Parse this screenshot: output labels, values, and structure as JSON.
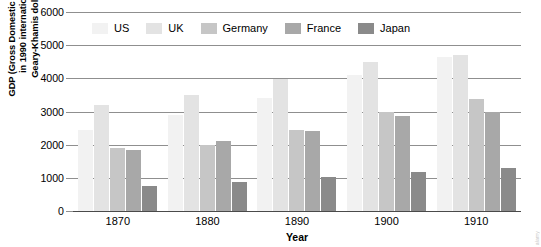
{
  "chart_data": {
    "type": "bar",
    "title": "",
    "xlabel": "Year",
    "ylabel": "GDP (Gross Domestic Product) in 1990 international Geary-Khamis dollars*",
    "ylabel_lines": [
      "GDP (Gross Domestic Product)",
      "in 1990 international",
      "Geary-Khamis dollars*"
    ],
    "categories": [
      "1870",
      "1880",
      "1890",
      "1900",
      "1910"
    ],
    "ylim": [
      0,
      6000
    ],
    "yticks": [
      0,
      1000,
      2000,
      3000,
      4000,
      5000,
      6000
    ],
    "ytick_labels": [
      "0",
      "1000",
      "2000",
      "3000",
      "4000",
      "5000",
      "6000"
    ],
    "grid": true,
    "legend_position": "top-left-inside",
    "series": [
      {
        "name": "US",
        "color": "#f2f2f2",
        "values": [
          2450,
          2900,
          3400,
          4100,
          4650
        ]
      },
      {
        "name": "UK",
        "color": "#e3e3e3",
        "values": [
          3200,
          3500,
          3970,
          4500,
          4700
        ]
      },
      {
        "name": "Germany",
        "color": "#c6c6c6",
        "values": [
          1900,
          2000,
          2430,
          3000,
          3380
        ]
      },
      {
        "name": "France",
        "color": "#a8a8a8",
        "values": [
          1850,
          2100,
          2400,
          2870,
          3000
        ]
      },
      {
        "name": "Japan",
        "color": "#8a8a8a",
        "values": [
          740,
          880,
          1020,
          1180,
          1300
        ]
      }
    ]
  },
  "watermark": {
    "text": "alamy"
  },
  "colors": {
    "gridline": "#8f8f8f",
    "axis": "#4a4a4a",
    "text": "#000000",
    "background": "#ffffff"
  }
}
